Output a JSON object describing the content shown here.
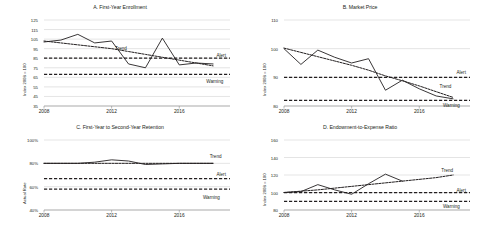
{
  "figure": {
    "background": "#ffffff",
    "series_colors": {
      "actual": "#231f20",
      "trend": "#231f20",
      "alert": "#231f20",
      "warning": "#231f20",
      "grid": "#c9c9c9"
    },
    "xticks": [
      "2008",
      "2012",
      "2016"
    ],
    "annotation_labels": {
      "trend": "Trend",
      "alert": "Alert",
      "warning": "Warning"
    }
  },
  "chart_data": [
    {
      "id": "A",
      "type": "line",
      "title": "A. First-Year Enrollment",
      "xlabel": "",
      "ylabel": "Index 2008 = 100",
      "xlim": [
        2008,
        2019
      ],
      "ylim": [
        35,
        125
      ],
      "yticks": [
        125,
        115,
        105,
        95,
        85,
        75,
        65,
        55,
        45,
        35
      ],
      "xticks": [
        2008,
        2012,
        2016
      ],
      "xtick_labels": [
        "2008",
        "2012",
        "2016"
      ],
      "grid": true,
      "legend_position": "inline-annotations",
      "x": [
        2008,
        2009,
        2010,
        2011,
        2012,
        2013,
        2014,
        2015,
        2016,
        2017,
        2018
      ],
      "series": [
        {
          "name": "Actual",
          "style": "solid",
          "values": [
            102,
            104,
            110,
            101,
            103,
            79,
            75,
            106,
            78,
            80,
            79
          ]
        },
        {
          "name": "Trend",
          "style": "dashed",
          "values": [
            103,
            101,
            99,
            97,
            95,
            92,
            89,
            86,
            83,
            80,
            77
          ]
        },
        {
          "name": "Alert",
          "style": "dashed-bold",
          "constant": 85
        },
        {
          "name": "Warning",
          "style": "dashed-bold",
          "constant": 68
        }
      ],
      "annotations": [
        {
          "label": "Trend",
          "x": 2012.2,
          "y": 96
        },
        {
          "label": "Alert",
          "x": 2018.2,
          "y": 88
        },
        {
          "label": "Warning",
          "x": 2017.6,
          "y": 61
        }
      ]
    },
    {
      "id": "B",
      "type": "line",
      "title": "B. Market Price",
      "xlabel": "",
      "ylabel": "Index 2008 = 100",
      "xlim": [
        2008,
        2019
      ],
      "ylim": [
        80,
        110
      ],
      "yticks": [
        110,
        100,
        90,
        80
      ],
      "xticks": [
        2008,
        2012,
        2016
      ],
      "xtick_labels": [
        "2008",
        "2012",
        "2016"
      ],
      "grid": true,
      "legend_position": "inline-annotations",
      "x": [
        2008,
        2009,
        2010,
        2011,
        2012,
        2013,
        2014,
        2015,
        2016,
        2017,
        2018
      ],
      "series": [
        {
          "name": "Actual",
          "style": "solid",
          "values": [
            100,
            94.5,
            99.5,
            97,
            95,
            96.5,
            85.5,
            89,
            86,
            83.5,
            82.5
          ]
        },
        {
          "name": "Trend",
          "style": "dashed",
          "values": [
            100.2,
            98.7,
            97.2,
            95.7,
            94.2,
            92.5,
            90.5,
            88.8,
            87,
            85,
            83
          ]
        },
        {
          "name": "Alert",
          "style": "dashed-bold",
          "constant": 90
        },
        {
          "name": "Warning",
          "style": "dashed-bold",
          "constant": 82
        }
      ],
      "annotations": [
        {
          "label": "Alert",
          "x": 2018.2,
          "y": 92
        },
        {
          "label": "Trend",
          "x": 2017.2,
          "y": 87
        },
        {
          "label": "Warning",
          "x": 2017.4,
          "y": 80.3
        }
      ]
    },
    {
      "id": "C",
      "type": "line",
      "title": "C. First-Year to Second-Year Retention",
      "xlabel": "",
      "ylabel": "Actual Rate",
      "xlim": [
        2008,
        2019
      ],
      "ylim": [
        40,
        100
      ],
      "yticks": [
        100,
        80,
        60,
        40
      ],
      "ytick_labels": [
        "100%",
        "80%",
        "60%",
        "40%"
      ],
      "xticks": [
        2008,
        2012,
        2016
      ],
      "xtick_labels": [
        "2008",
        "2012",
        "2016"
      ],
      "grid": true,
      "legend_position": "inline-annotations",
      "x": [
        2008,
        2009,
        2010,
        2011,
        2012,
        2013,
        2014,
        2015,
        2016,
        2017,
        2018
      ],
      "series": [
        {
          "name": "Actual",
          "style": "solid",
          "values": [
            80,
            80,
            80,
            81,
            83,
            82,
            79,
            79.5,
            80,
            80,
            80
          ]
        },
        {
          "name": "Trend",
          "style": "dashed",
          "values": [
            80,
            80,
            80,
            80,
            80,
            80,
            80,
            80,
            80,
            80,
            80
          ]
        },
        {
          "name": "Alert",
          "style": "dashed-bold",
          "constant": 67
        },
        {
          "name": "Warning",
          "style": "dashed-bold",
          "constant": 58
        }
      ],
      "annotations": [
        {
          "label": "Trend",
          "x": 2017.8,
          "y": 86
        },
        {
          "label": "Alert",
          "x": 2018.2,
          "y": 70.5
        },
        {
          "label": "Warning",
          "x": 2017.4,
          "y": 51
        }
      ]
    },
    {
      "id": "D",
      "type": "line",
      "title": "D. Endowment-to-Expense Ratio",
      "xlabel": "",
      "ylabel": "Index 2008 = 100",
      "xlim": [
        2008,
        2019
      ],
      "ylim": [
        80,
        160
      ],
      "yticks": [
        160,
        140,
        120,
        100,
        80
      ],
      "xticks": [
        2008,
        2012,
        2016
      ],
      "xtick_labels": [
        "2008",
        "2012",
        "2016"
      ],
      "grid": true,
      "legend_position": "inline-annotations",
      "x": [
        2008,
        2009,
        2010,
        2011,
        2012,
        2013,
        2014,
        2015
      ],
      "series": [
        {
          "name": "Actual",
          "style": "solid",
          "values": [
            100,
            101,
            109,
            103,
            98,
            110,
            121,
            113
          ]
        },
        {
          "name": "Trend",
          "style": "dashed",
          "values": [
            100,
            101.5,
            103,
            105,
            107,
            109,
            111,
            113,
            115,
            117,
            120
          ]
        },
        {
          "name": "Alert",
          "style": "dashed-bold",
          "constant": 100
        },
        {
          "name": "Warning",
          "style": "dashed-bold",
          "constant": 90
        }
      ],
      "annotations": [
        {
          "label": "Trend",
          "x": 2017.3,
          "y": 126
        },
        {
          "label": "Alert",
          "x": 2018.2,
          "y": 103
        },
        {
          "label": "Warning",
          "x": 2017.4,
          "y": 85
        }
      ]
    }
  ]
}
